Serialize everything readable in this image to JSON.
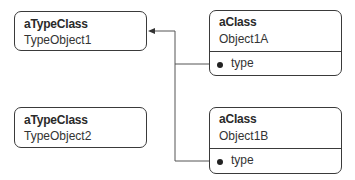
{
  "type_objects": [
    {
      "class": "aTypeClass",
      "name": "TypeObject1"
    },
    {
      "class": "aTypeClass",
      "name": "TypeObject2"
    }
  ],
  "objects": [
    {
      "class": "aClass",
      "name": "Object1A",
      "attribute": "type"
    },
    {
      "class": "aClass",
      "name": "Object1B",
      "attribute": "type"
    }
  ],
  "relations": [
    {
      "from": "Object1A.type",
      "to": "TypeObject1"
    },
    {
      "from": "Object1B.type",
      "to": "TypeObject1"
    }
  ]
}
